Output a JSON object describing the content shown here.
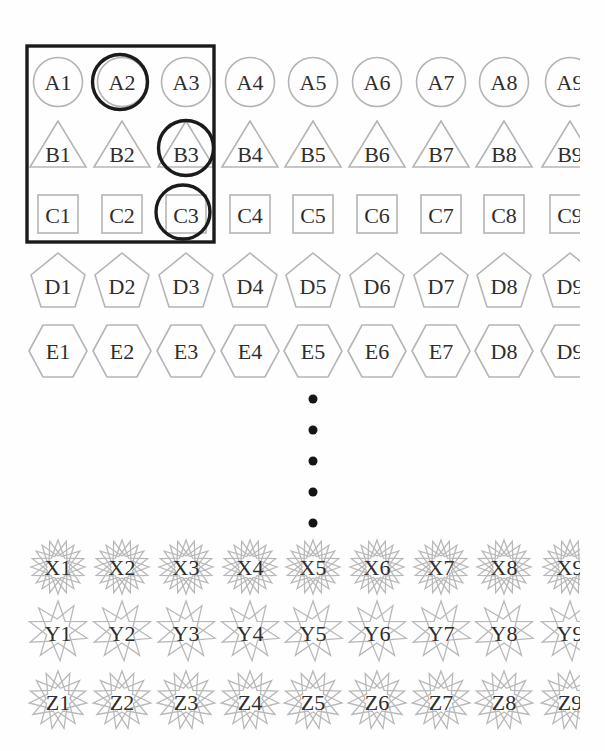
{
  "figure": {
    "background_color": "#fefefe",
    "outline_color": "#b5b5b5",
    "star_color": "#b9b9b9",
    "label_color": "#2e2e2e",
    "annotation_color": "#1b1b1b",
    "dot_color": "#151515",
    "grid": {
      "col_centers": [
        58,
        122,
        186,
        250,
        313,
        377,
        441,
        504,
        570
      ],
      "rows": [
        {
          "name": "row-a",
          "shape": "circle",
          "y": 82,
          "label_dy": 0,
          "labels": [
            "A1",
            "A2",
            "A3",
            "A4",
            "A5",
            "A6",
            "A7",
            "A8",
            "A9"
          ]
        },
        {
          "name": "row-b",
          "shape": "triangle",
          "y": 146,
          "label_dy": 8,
          "labels": [
            "B1",
            "B2",
            "B3",
            "B4",
            "B5",
            "B6",
            "B7",
            "B8",
            "B9"
          ]
        },
        {
          "name": "row-c",
          "shape": "square",
          "y": 214,
          "label_dy": 1,
          "labels": [
            "C1",
            "C2",
            "C3",
            "C4",
            "C5",
            "C6",
            "C7",
            "C8",
            "C9"
          ]
        },
        {
          "name": "row-d",
          "shape": "pentagon",
          "y": 281,
          "label_dy": 5,
          "labels": [
            "D1",
            "D2",
            "D3",
            "D4",
            "D5",
            "D6",
            "D7",
            "D8",
            "D9"
          ]
        },
        {
          "name": "row-e",
          "shape": "hexagon",
          "y": 351,
          "label_dy": 0,
          "labels": [
            "E1",
            "E2",
            "E3",
            "E4",
            "E5",
            "E6",
            "E7",
            "D8",
            "D9"
          ]
        },
        {
          "name": "row-x",
          "shape": "star-burst",
          "y": 567,
          "label_dy": 0,
          "labels": [
            "X1",
            "X2",
            "X3",
            "X4",
            "X5",
            "X6",
            "X7",
            "X8",
            "X9"
          ]
        },
        {
          "name": "row-y",
          "shape": "star-double",
          "y": 631,
          "label_dy": 2,
          "labels": [
            "Y1",
            "Y2",
            "Y3",
            "Y4",
            "Y5",
            "Y6",
            "Y7",
            "Y8",
            "Y9"
          ]
        },
        {
          "name": "row-z",
          "shape": "star-triple",
          "y": 700,
          "label_dy": 2,
          "labels": [
            "Z1",
            "Z2",
            "Z3",
            "Z4",
            "Z5",
            "Z6",
            "Z7",
            "Z8",
            "Z9"
          ]
        }
      ]
    },
    "ellipsis_dots": {
      "x": 313,
      "y_start": 399,
      "spacing": 31,
      "count": 5,
      "radius": 4.5
    },
    "annotations": {
      "selection_rect": {
        "x": 27,
        "y": 46,
        "width": 187,
        "height": 196,
        "stroke_width": 3.4
      },
      "selection_circles": [
        {
          "target": "A2",
          "cx": 120,
          "cy": 82,
          "r": 27.5
        },
        {
          "target": "B3",
          "cx": 186,
          "cy": 148,
          "r": 27.5
        },
        {
          "target": "C3",
          "cx": 183,
          "cy": 212,
          "r": 27
        }
      ],
      "circle_stroke_width": 3.4
    },
    "scan_cut": {
      "x": 580,
      "width": 25
    }
  }
}
